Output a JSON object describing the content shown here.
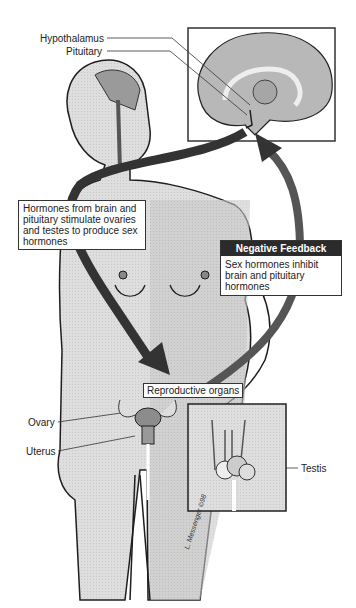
{
  "diagram": {
    "type": "anatomical-illustration",
    "labels": {
      "hypothalamus": "Hypothalamus",
      "pituitary": "Pituitary",
      "ovary": "Ovary",
      "uterus": "Uterus",
      "testis": "Testis",
      "reproductive_organs": "Reproductive organs"
    },
    "callouts": {
      "stimulation": "Hormones from brain and pituitary stimulate ovaries and testes to produce sex hormones",
      "negative_feedback": {
        "title": "Negative Feedback",
        "text": "Sex hormones inhibit brain and pituitary hormones"
      }
    },
    "signature": "L. Messenger ©98",
    "insets": [
      "brain-sagittal-section",
      "male-testes"
    ],
    "arrows": [
      {
        "from": "brain",
        "to": "reproductive organs",
        "meaning": "stimulation"
      },
      {
        "from": "reproductive organs",
        "to": "brain",
        "meaning": "negative feedback"
      }
    ],
    "colors": {
      "arrow": "#3a3a3a",
      "body_fill": "#c8c8c8",
      "outline": "#1e1e1e",
      "box_header": "#2b2b2b"
    }
  }
}
